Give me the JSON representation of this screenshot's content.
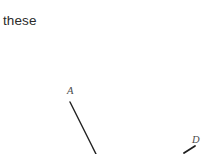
{
  "page": {
    "width": 203,
    "height": 154,
    "background_color": "#ffffff",
    "kind": "cropped-geometry-worksheet-fragment"
  },
  "text": {
    "paragraph_fragment": "these"
  },
  "figure": {
    "stroke_color": "#1f1f1f",
    "label_color": "#4a4a4a",
    "labels": [
      {
        "id": "A",
        "text": "A",
        "x": 67,
        "y": 86
      },
      {
        "id": "D",
        "text": "D",
        "x": 192,
        "y": 135
      }
    ],
    "segments": [
      {
        "id": "segment-from-A",
        "from_label": "A",
        "x1": 70,
        "y1": 102,
        "x2": 96,
        "y2": 154,
        "width": 1.4
      },
      {
        "id": "segment-near-D",
        "from_label": "D",
        "x1": 184,
        "y1": 153,
        "x2": 195,
        "y2": 146,
        "width": 1.8
      }
    ]
  }
}
